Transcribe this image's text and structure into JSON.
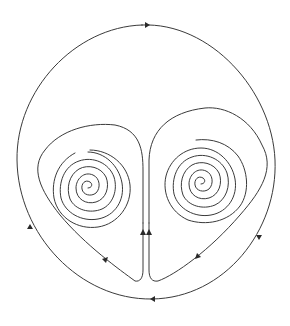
{
  "diagram": {
    "type": "phase-portrait",
    "background": "#ffffff",
    "stroke_color": "#3a3a3a",
    "outer_orbit": {
      "arrows": [
        {
          "position": "top",
          "direction": "right"
        },
        {
          "position": "left",
          "direction": "up"
        },
        {
          "position": "right",
          "direction": "down"
        },
        {
          "position": "bottom",
          "direction": "left"
        }
      ]
    },
    "left_lobe": {
      "spiral_center": [
        88,
        188
      ],
      "arrows": [
        {
          "position": "lower-left edge",
          "direction": "down-right"
        },
        {
          "position": "central stem",
          "direction": "up"
        }
      ]
    },
    "right_lobe": {
      "spiral_center": [
        201,
        184
      ],
      "arrows": [
        {
          "position": "lower-right edge",
          "direction": "down-left"
        },
        {
          "position": "central stem",
          "direction": "up"
        }
      ]
    }
  }
}
